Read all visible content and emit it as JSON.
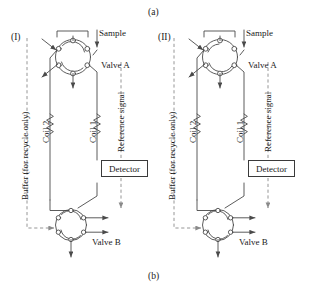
{
  "figure": {
    "top_caption": "(a)",
    "bottom_caption": "(b)",
    "background_color": "#ffffff",
    "line_color": "#4a4a4a",
    "text_color": "#1a1a1a",
    "dashed_color": "#8a8a8a"
  },
  "panels": [
    {
      "id": "panel-I",
      "label": "(I)",
      "buffer_label": "Buffer (for recycle only)",
      "sample_label": "Sample",
      "valve_a_label": "Valve A",
      "valve_b_label": "Valve B",
      "coil1_label": "Coil 1",
      "coil2_label": "Coil 2",
      "reference_label": "Reference signal",
      "detector_label": "Detector"
    },
    {
      "id": "panel-II",
      "label": "(II)",
      "buffer_label": "Buffer (for recycle only)",
      "sample_label": "Sample",
      "valve_a_label": "Valve A",
      "valve_b_label": "Valve B",
      "coil1_label": "Coil 1",
      "coil2_label": "Coil 2",
      "reference_label": "Reference signal",
      "detector_label": "Detector"
    }
  ]
}
